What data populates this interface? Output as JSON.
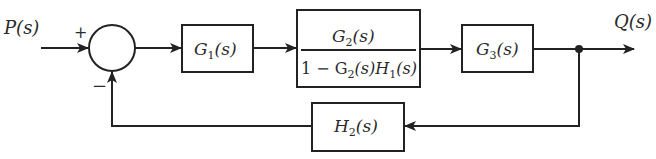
{
  "diagram": {
    "type": "block-diagram",
    "input": {
      "label": "P(s)"
    },
    "output": {
      "label": "Q(s)"
    },
    "summing_junction": {
      "plus_sign": "+",
      "minus_sign": "−"
    },
    "blocks": {
      "g1": {
        "label": "G",
        "sub": "1",
        "arg": "(s)"
      },
      "inner_loop": {
        "numerator": {
          "label": "G",
          "sub": "2",
          "arg": "(s)"
        },
        "denominator": {
          "prefix": "1 − G",
          "g_sub": "2",
          "mid": "(s)H",
          "h_sub": "1",
          "arg": "(s)"
        }
      },
      "g3": {
        "label": "G",
        "sub": "3",
        "arg": "(s)"
      },
      "h2": {
        "label": "H",
        "sub": "2",
        "arg": "(s)"
      }
    },
    "colors": {
      "line": "#222222",
      "background": "#ffffff"
    }
  }
}
